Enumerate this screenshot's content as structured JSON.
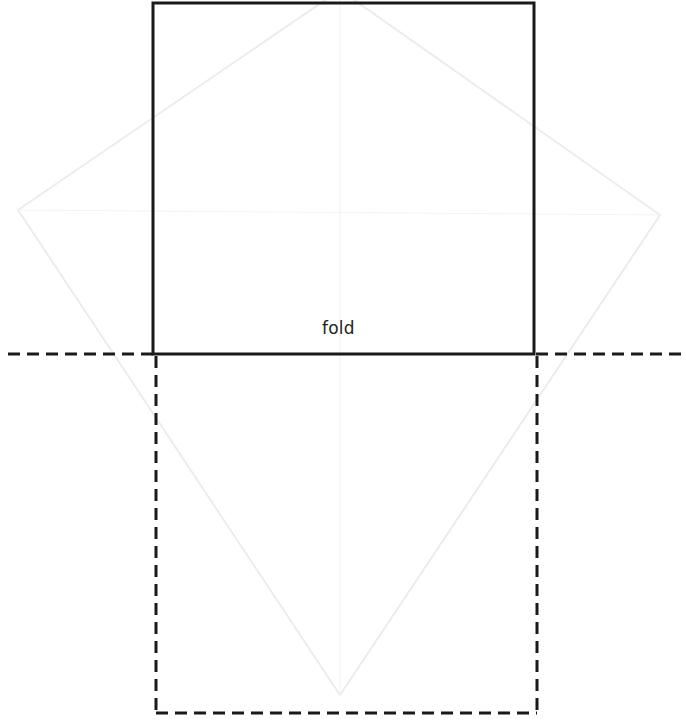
{
  "diagram": {
    "fold_label": "fold",
    "colors": {
      "stroke": "#1a1a1a",
      "ghost": "#ececec",
      "background": "#ffffff"
    },
    "solid_square": {
      "x1": 153,
      "y1": 3,
      "x2": 534,
      "y2": 354
    },
    "dashed_square": {
      "x1": 156,
      "y1": 354,
      "x2": 537,
      "y2": 713
    },
    "fold_line": {
      "y": 354,
      "x1": 8,
      "x2": 686
    },
    "ghost_diamond": {
      "top": [
        340,
        -10
      ],
      "right": [
        660,
        215
      ],
      "bottom": [
        340,
        695
      ],
      "left": [
        18,
        210
      ]
    }
  }
}
